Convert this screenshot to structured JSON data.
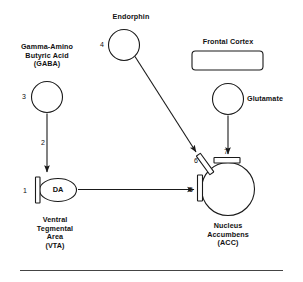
{
  "diagram": {
    "background_color": "#ffffff",
    "stroke_color": "#1a1a1a",
    "structures": {
      "gaba": {
        "label_lines": "Gamma-Amino\nButyric Acid\n(GABA)",
        "marker": "3"
      },
      "endorphin": {
        "label": "Endorphin",
        "marker": "4"
      },
      "frontal_cortex": {
        "label": "Frontal Cortex"
      },
      "glutamate": {
        "label": "Glutamate"
      },
      "vta": {
        "node_label": "DA",
        "label_lines": "Ventral\nTegmental\nArea\n(VTA)",
        "marker": "1"
      },
      "acc": {
        "label_lines": "Nucleus\nAccumbens\n(ACC)",
        "markers": {
          "left": "5",
          "upper_left": "6",
          "top": "7"
        }
      }
    },
    "arrows": {
      "gaba_to_vta": "2",
      "endorphin_to_acc": "",
      "glutamate_to_acc": "",
      "vta_to_acc": ""
    }
  }
}
